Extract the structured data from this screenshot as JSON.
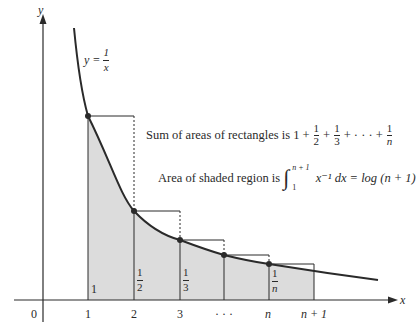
{
  "figure": {
    "axes": {
      "x_label": "x",
      "y_label": "y",
      "origin_label": "0"
    },
    "curve_label": {
      "lhs": "y =",
      "num": "1",
      "den": "x"
    },
    "x_ticks": [
      "1",
      "2",
      "3",
      "· · ·",
      "n",
      "n + 1"
    ],
    "rect_labels": [
      {
        "text": "1"
      },
      {
        "num": "1",
        "den": "2"
      },
      {
        "num": "1",
        "den": "3"
      },
      {
        "num": "1",
        "den": "n"
      }
    ],
    "caption_sum": {
      "prefix": "Sum of areas of rectangles is 1 +",
      "terms": [
        {
          "num": "1",
          "den": "2"
        },
        {
          "num": "1",
          "den": "3"
        }
      ],
      "mid": "+ · · · +",
      "last": {
        "num": "1",
        "den": "n"
      },
      "plus": "+"
    },
    "caption_area": {
      "prefix": "Area of shaded region is",
      "upper": "n + 1",
      "lower": "1",
      "integrand": "x⁻¹ dx = log (n + 1)"
    },
    "colors": {
      "shade": "#d9d9d9",
      "line": "#2a2a2a"
    }
  }
}
